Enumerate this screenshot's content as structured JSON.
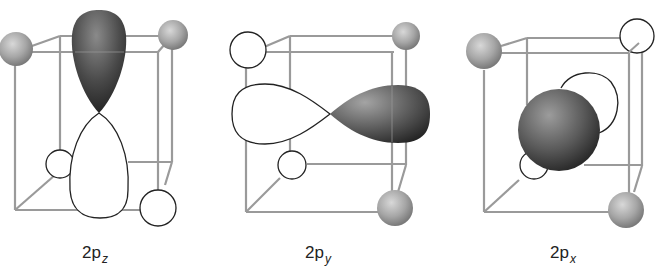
{
  "figure": {
    "panels": [
      {
        "id": "2pz",
        "label_main": "2p",
        "label_sub": "z",
        "lobe_axis": "vertical",
        "shaded_lobe": "top",
        "open_lobe": "bottom"
      },
      {
        "id": "2py",
        "label_main": "2p",
        "label_sub": "y",
        "lobe_axis": "horizontal",
        "shaded_lobe": "right",
        "open_lobe": "left"
      },
      {
        "id": "2px",
        "label_main": "2p",
        "label_sub": "x",
        "lobe_axis": "depth",
        "shaded_lobe": "front",
        "open_lobe": "back"
      }
    ],
    "colors": {
      "cube_edge": "#9a9a9a",
      "shaded_lobe_dark": "#2e2e2e",
      "shaded_lobe_light": "#9a9a9a",
      "open_lobe_fill": "#ffffff",
      "open_lobe_stroke": "#222222",
      "corner_sphere": "#a8a8a8"
    }
  }
}
